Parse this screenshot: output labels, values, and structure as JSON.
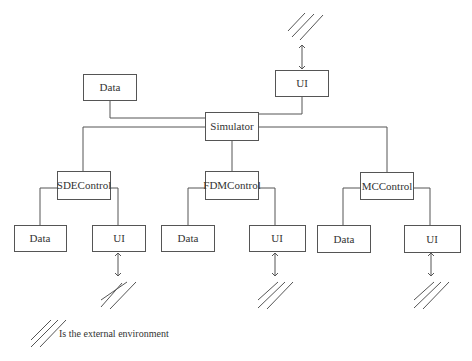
{
  "diagram": {
    "nodes": {
      "simulator": {
        "label": "Simulator"
      },
      "top_data": {
        "label": "Data"
      },
      "top_ui": {
        "label": "UI"
      },
      "sde_control": {
        "label": "SDEControl"
      },
      "fdm_control": {
        "label": "FDMControl"
      },
      "mc_control": {
        "label": "MCControl"
      },
      "sde_data": {
        "label": "Data"
      },
      "sde_ui": {
        "label": "UI"
      },
      "fdm_data": {
        "label": "Data"
      },
      "fdm_ui": {
        "label": "UI"
      },
      "mc_data": {
        "label": "Data"
      },
      "mc_ui": {
        "label": "UI"
      }
    },
    "edges": [
      {
        "from": "top_data",
        "to": "simulator"
      },
      {
        "from": "top_ui",
        "to": "simulator"
      },
      {
        "from": "simulator",
        "to": "sde_control"
      },
      {
        "from": "simulator",
        "to": "fdm_control"
      },
      {
        "from": "simulator",
        "to": "mc_control"
      },
      {
        "from": "sde_control",
        "to": "sde_data"
      },
      {
        "from": "sde_control",
        "to": "sde_ui"
      },
      {
        "from": "fdm_control",
        "to": "fdm_data"
      },
      {
        "from": "fdm_control",
        "to": "fdm_ui"
      },
      {
        "from": "mc_control",
        "to": "mc_data"
      },
      {
        "from": "mc_control",
        "to": "mc_ui"
      },
      {
        "from": "top_ui",
        "to": "external_environment",
        "type": "bidirectional-arrow"
      },
      {
        "from": "sde_ui",
        "to": "external_environment",
        "type": "bidirectional-arrow"
      },
      {
        "from": "fdm_ui",
        "to": "external_environment",
        "type": "bidirectional-arrow"
      },
      {
        "from": "mc_ui",
        "to": "external_environment",
        "type": "bidirectional-arrow"
      }
    ],
    "legend": {
      "symbol": "hatch",
      "text": "Is the external environment"
    },
    "colors": {
      "stroke": "#555555",
      "text": "#333333",
      "background": "#ffffff"
    }
  }
}
